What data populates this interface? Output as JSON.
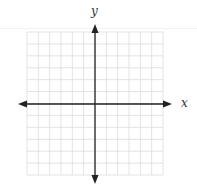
{
  "diagram": {
    "type": "coordinate-plane",
    "x_axis_label": "x",
    "y_axis_label": "y",
    "grid": {
      "columns": 12,
      "rows": 12,
      "left": 27,
      "top": 32,
      "right": 163,
      "bottom": 175,
      "line_color": "#dcdcdc"
    },
    "axes": {
      "origin_x": 95,
      "origin_y": 104,
      "x_start": 18,
      "x_end": 172,
      "y_start": 24,
      "y_end": 184,
      "color": "#222222"
    }
  }
}
